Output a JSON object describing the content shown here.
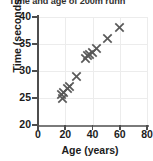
{
  "chart_data": {
    "type": "scatter",
    "title_visible": "Time and age of 200m runn",
    "xlabel": "Age (years)",
    "ylabel": "Time (seconds)",
    "xlim": [
      0,
      80
    ],
    "ylim": [
      20,
      40
    ],
    "xticks": [
      0,
      20,
      40,
      60,
      80
    ],
    "yticks": [
      20,
      25,
      30,
      35,
      40
    ],
    "xtick_labels": [
      "0",
      "20",
      "40",
      "60",
      "80"
    ],
    "ytick_labels": [
      "20",
      "25",
      "30",
      "35",
      "40"
    ],
    "grid": true,
    "legend": false,
    "marker": "x",
    "marker_color": "#595959",
    "points": [
      {
        "x": 17,
        "y": 25.7
      },
      {
        "x": 18,
        "y": 25.0
      },
      {
        "x": 19,
        "y": 26.1
      },
      {
        "x": 22,
        "y": 26.8
      },
      {
        "x": 23,
        "y": 27.1
      },
      {
        "x": 28,
        "y": 29.0
      },
      {
        "x": 35,
        "y": 32.3
      },
      {
        "x": 36,
        "y": 32.8
      },
      {
        "x": 38,
        "y": 33.1
      },
      {
        "x": 40,
        "y": 33.4
      },
      {
        "x": 43,
        "y": 34.1
      },
      {
        "x": 51,
        "y": 36.0
      },
      {
        "x": 60,
        "y": 38.1
      }
    ]
  },
  "axes": {
    "y_title": "Time (seconds)",
    "x_title": "Age (years)"
  },
  "colors": {
    "marker": "#595959",
    "axis": "#4d4d4d",
    "grid": "#ececec",
    "text": "#1c1c1c",
    "title": "#33322f",
    "background": "#ffffff"
  }
}
